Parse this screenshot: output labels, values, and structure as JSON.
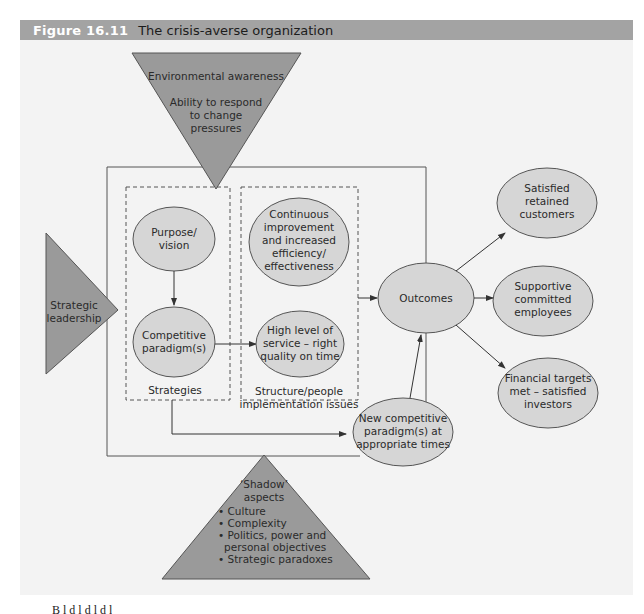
{
  "header": {
    "figure_number": "Figure 16.11",
    "title": "The crisis-averse organization"
  },
  "colors": {
    "header_bg": "#a3a3a3",
    "panel_bg": "#f3f3f3",
    "triangle_fill": "#9a9a9a",
    "ellipse_fill": "#d6d6d6",
    "stroke": "#555555"
  },
  "top_triangle": {
    "line1": "Environmental awareness",
    "line2": "Ability to respond",
    "line3": "to change",
    "line4": "pressures"
  },
  "left_triangle": {
    "line1": "Strategic",
    "line2": "leadership"
  },
  "strategies_box": {
    "label": "Strategies",
    "purpose": {
      "line1": "Purpose/",
      "line2": "vision"
    },
    "competitive": {
      "line1": "Competitive",
      "line2": "paradigm(s)"
    }
  },
  "structure_box": {
    "label_line1": "Structure/people",
    "label_line2": "implementation issues",
    "continuous": {
      "line1": "Continuous",
      "line2": "improvement",
      "line3": "and increased",
      "line4": "efficiency/",
      "line5": "effectiveness"
    },
    "service": {
      "line1": "High level of",
      "line2": "service – right",
      "line3": "quality on time"
    }
  },
  "outcomes": {
    "label": "Outcomes"
  },
  "new_paradigm": {
    "line1": "New competitive",
    "line2": "paradigm(s) at",
    "line3": "appropriate times"
  },
  "results": [
    {
      "line1": "Satisfied",
      "line2": "retained",
      "line3": "customers"
    },
    {
      "line1": "Supportive",
      "line2": "committed",
      "line3": "employees"
    },
    {
      "line1": "Financial targets",
      "line2": "met – satisfied",
      "line3": "investors"
    }
  ],
  "shadow_triangle": {
    "title_line1": "‘Shadow’",
    "title_line2": "aspects",
    "bullets": [
      "• Culture",
      "• Complexity",
      "• Politics, power and",
      "  personal objectives",
      "• Strategic paradoxes"
    ]
  },
  "footer": {
    "partial_text": "B     l     d                   l       d        l d                          l"
  }
}
